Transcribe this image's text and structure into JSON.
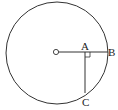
{
  "diagram": {
    "type": "geometry",
    "colors": {
      "stroke": "#333333",
      "background": "#ffffff"
    },
    "circle": {
      "cx": 57,
      "cy": 53,
      "r": 51
    },
    "points": {
      "center": {
        "label": "",
        "x": 56,
        "y": 52
      },
      "A": {
        "label": "A",
        "x": 85,
        "y": 52
      },
      "B": {
        "label": "B",
        "x": 108,
        "y": 52
      },
      "C": {
        "label": "C",
        "x": 85,
        "y": 94
      }
    },
    "annotations": {
      "right_angle_at": "A"
    }
  }
}
